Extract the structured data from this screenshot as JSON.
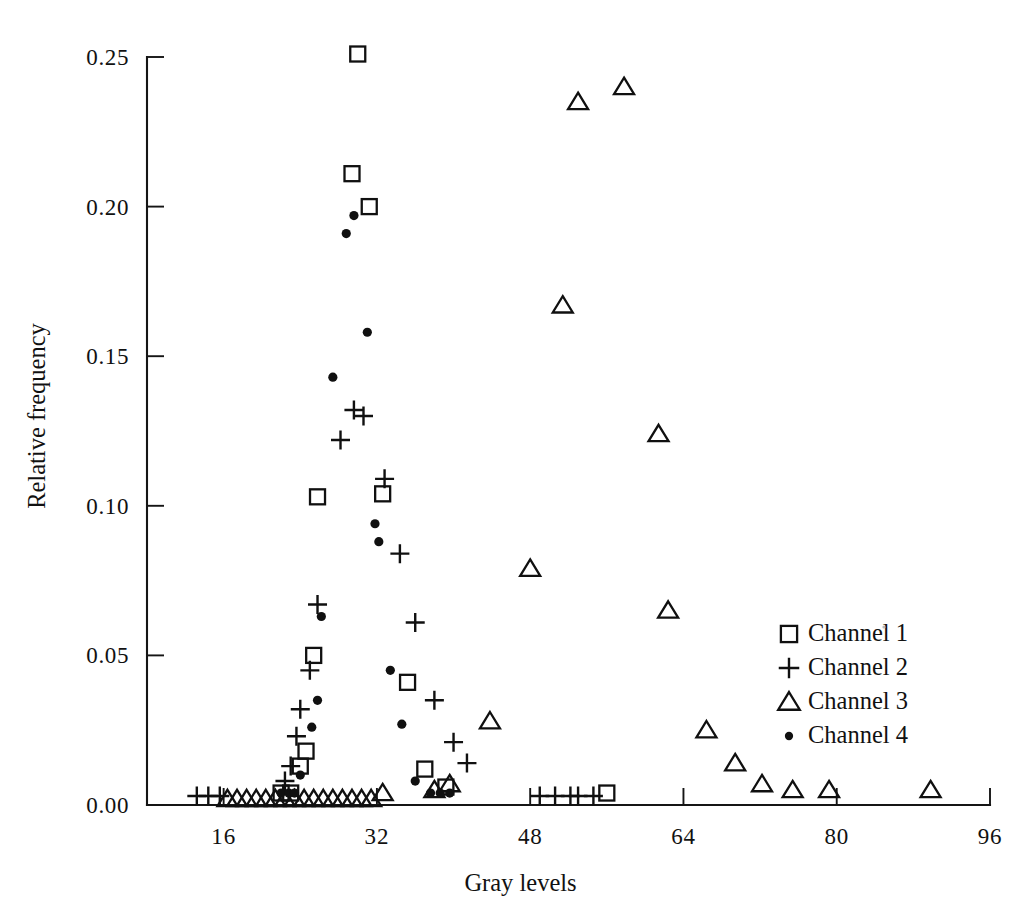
{
  "figure": {
    "background": "#ffffff",
    "ink_color": "#101010"
  },
  "axes": {
    "x_title": "Gray levels",
    "y_title": "Relative frequency",
    "x_ticks": [
      "16",
      "32",
      "48",
      "64",
      "80",
      "96"
    ],
    "y_ticks": [
      "0.00",
      "0.05",
      "0.10",
      "0.15",
      "0.20",
      "0.25"
    ]
  },
  "legend": {
    "entries": [
      {
        "label": "Channel 1",
        "marker": "square-marker"
      },
      {
        "label": "Channel 2",
        "marker": "plus-marker"
      },
      {
        "label": "Channel 3",
        "marker": "triangle-marker"
      },
      {
        "label": "Channel 4",
        "marker": "dot-marker"
      }
    ]
  },
  "chart_data": {
    "type": "scatter",
    "title": "",
    "xlabel": "Gray levels",
    "ylabel": "Relative frequency",
    "xlim": [
      8,
      96
    ],
    "ylim": [
      0.0,
      0.26
    ],
    "xticks": [
      16,
      32,
      48,
      64,
      80,
      96
    ],
    "yticks": [
      0.0,
      0.05,
      0.1,
      0.15,
      0.2,
      0.25
    ],
    "grid": false,
    "legend_position": "right-middle",
    "series": [
      {
        "name": "Channel 1",
        "marker": "square",
        "points": [
          [
            22.0,
            0.004
          ],
          [
            23.0,
            0.004
          ],
          [
            24.0,
            0.013
          ],
          [
            24.6,
            0.018
          ],
          [
            25.4,
            0.05
          ],
          [
            25.8,
            0.103
          ],
          [
            29.4,
            0.211
          ],
          [
            30.0,
            0.251
          ],
          [
            31.2,
            0.2
          ],
          [
            32.6,
            0.104
          ],
          [
            35.2,
            0.041
          ],
          [
            37.0,
            0.012
          ],
          [
            39.2,
            0.006
          ],
          [
            56.0,
            0.004
          ]
        ]
      },
      {
        "name": "Channel 2",
        "marker": "plus",
        "points": [
          [
            13.2,
            0.003
          ],
          [
            14.4,
            0.003
          ],
          [
            15.6,
            0.003
          ],
          [
            22.4,
            0.008
          ],
          [
            23.0,
            0.013
          ],
          [
            23.6,
            0.023
          ],
          [
            24.0,
            0.032
          ],
          [
            25.0,
            0.045
          ],
          [
            25.8,
            0.067
          ],
          [
            28.2,
            0.122
          ],
          [
            29.6,
            0.132
          ],
          [
            30.6,
            0.13
          ],
          [
            32.8,
            0.109
          ],
          [
            34.4,
            0.084
          ],
          [
            36.0,
            0.061
          ],
          [
            38.0,
            0.035
          ],
          [
            40.0,
            0.021
          ],
          [
            41.4,
            0.014
          ],
          [
            49.0,
            0.003
          ],
          [
            50.6,
            0.003
          ],
          [
            52.2,
            0.003
          ],
          [
            53.0,
            0.003
          ],
          [
            54.6,
            0.003
          ]
        ]
      },
      {
        "name": "Channel 3",
        "marker": "triangle",
        "points": [
          [
            16.4,
            0.002
          ],
          [
            17.4,
            0.002
          ],
          [
            18.4,
            0.002
          ],
          [
            19.4,
            0.002
          ],
          [
            20.4,
            0.002
          ],
          [
            21.4,
            0.002
          ],
          [
            22.4,
            0.002
          ],
          [
            23.4,
            0.002
          ],
          [
            24.4,
            0.002
          ],
          [
            25.4,
            0.002
          ],
          [
            26.4,
            0.002
          ],
          [
            27.4,
            0.002
          ],
          [
            28.4,
            0.002
          ],
          [
            29.4,
            0.002
          ],
          [
            30.4,
            0.002
          ],
          [
            31.4,
            0.002
          ],
          [
            32.6,
            0.004
          ],
          [
            38.0,
            0.005
          ],
          [
            39.6,
            0.007
          ],
          [
            43.8,
            0.028
          ],
          [
            48.0,
            0.079
          ],
          [
            51.4,
            0.167
          ],
          [
            53.0,
            0.235
          ],
          [
            57.8,
            0.24
          ],
          [
            61.4,
            0.124
          ],
          [
            62.4,
            0.065
          ],
          [
            66.4,
            0.025
          ],
          [
            69.4,
            0.014
          ],
          [
            72.2,
            0.007
          ],
          [
            75.4,
            0.005
          ],
          [
            79.2,
            0.005
          ],
          [
            89.8,
            0.005
          ]
        ]
      },
      {
        "name": "Channel 4",
        "marker": "dot",
        "points": [
          [
            22.0,
            0.004
          ],
          [
            22.8,
            0.004
          ],
          [
            23.4,
            0.004
          ],
          [
            24.0,
            0.01
          ],
          [
            25.2,
            0.026
          ],
          [
            25.8,
            0.035
          ],
          [
            26.2,
            0.063
          ],
          [
            27.4,
            0.143
          ],
          [
            28.8,
            0.191
          ],
          [
            29.6,
            0.197
          ],
          [
            31.0,
            0.158
          ],
          [
            31.8,
            0.094
          ],
          [
            32.2,
            0.088
          ],
          [
            33.4,
            0.045
          ],
          [
            34.6,
            0.027
          ],
          [
            36.0,
            0.008
          ],
          [
            37.6,
            0.004
          ],
          [
            38.6,
            0.004
          ],
          [
            39.6,
            0.004
          ]
        ]
      }
    ]
  }
}
